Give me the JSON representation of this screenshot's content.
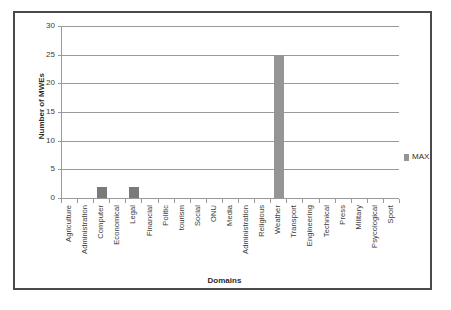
{
  "chart_data": {
    "type": "bar",
    "title": "",
    "xlabel": "Domains",
    "ylabel": "Number of MWEs",
    "ylim": [
      0,
      30
    ],
    "yticks": [
      0,
      5,
      10,
      15,
      20,
      25,
      30
    ],
    "grid": true,
    "legend_position": "right",
    "categories": [
      "Agriculture",
      "Administration",
      "Computer",
      "Economical",
      "Legal",
      "Financial",
      "Politic",
      "tourism",
      "Social",
      "ONU",
      "Media",
      "Administration",
      "Religious",
      "Weather",
      "Transport",
      "Engineering",
      "Technical",
      "Press",
      "Military",
      "Psycological",
      "Sport"
    ],
    "series": [
      {
        "name": "MAX",
        "color": "#959595",
        "values": [
          0,
          0,
          2,
          0,
          2,
          0,
          0,
          0,
          0,
          0,
          0,
          0,
          0,
          25,
          0,
          0,
          0,
          0,
          0,
          0,
          0
        ]
      }
    ]
  },
  "legend": {
    "entries": [
      {
        "label": "MAX",
        "color": "#959595"
      }
    ]
  },
  "axes": {
    "y_title": "Number of MWEs",
    "x_title": "Domains",
    "y_tick_labels": [
      "0",
      "5",
      "10",
      "15",
      "20",
      "25",
      "30"
    ]
  },
  "colors": {
    "bar_tall": "#959595",
    "bar_short": "#7a7a7a",
    "gridline": "#9a9a9a",
    "frame": "#4a4a4a",
    "text": "#3b3b3b",
    "background": "#ffffff"
  }
}
